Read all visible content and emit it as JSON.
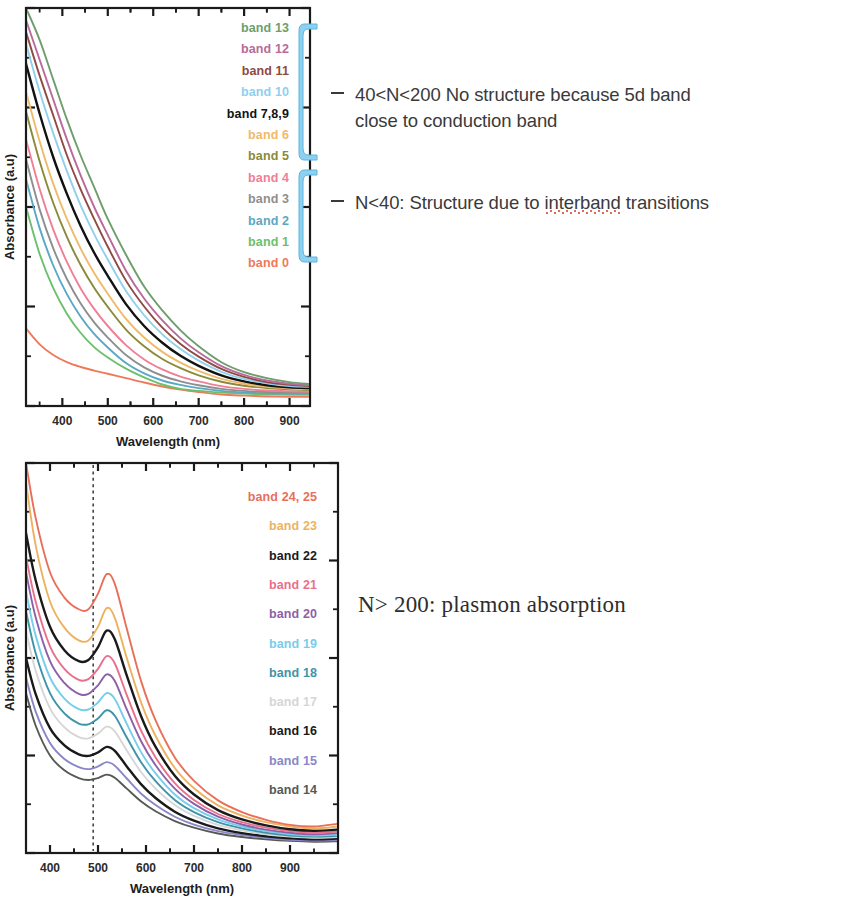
{
  "figures": [
    {
      "id": "top",
      "axis": {
        "xlabel": "Wavelength (nm)",
        "ylabel": "Absorbance (a.u)",
        "xticks": [
          "400",
          "500",
          "600",
          "700",
          "800",
          "900"
        ]
      },
      "legend": [
        {
          "label": "band 13",
          "color": "#6d9e6b"
        },
        {
          "label": "band 12",
          "color": "#b96a9a"
        },
        {
          "label": "band 11",
          "color": "#8e4a43"
        },
        {
          "label": "band 10",
          "color": "#8fd0ee"
        },
        {
          "label": "band 7,8,9",
          "color": "#121212"
        },
        {
          "label": "band 6",
          "color": "#f0ba6a"
        },
        {
          "label": "band 5",
          "color": "#8a8a38"
        },
        {
          "label": "band 4",
          "color": "#ef7f96"
        },
        {
          "label": "band 3",
          "color": "#8d8f8e"
        },
        {
          "label": "band 2",
          "color": "#5aa8c4"
        },
        {
          "label": "band 1",
          "color": "#6cc06c"
        },
        {
          "label": "band 0",
          "color": "#ef7a5a"
        }
      ]
    },
    {
      "id": "bottom",
      "axis": {
        "xlabel": "Wavelength (nm)",
        "ylabel": "Absorbance (a.u)",
        "xticks": [
          "400",
          "500",
          "600",
          "700",
          "800",
          "900"
        ]
      },
      "legend": [
        {
          "label": "band 24, 25",
          "color": "#e8705a"
        },
        {
          "label": "band 23",
          "color": "#edb25f"
        },
        {
          "label": "band 22",
          "color": "#1a1a1a"
        },
        {
          "label": "band 21",
          "color": "#e8708c"
        },
        {
          "label": "band 20",
          "color": "#8e5fa8"
        },
        {
          "label": "band 19",
          "color": "#77cdea"
        },
        {
          "label": "band 18",
          "color": "#3f93a8"
        },
        {
          "label": "band 17",
          "color": "#d6d6d6"
        },
        {
          "label": "band 16",
          "color": "#1a1a1a"
        },
        {
          "label": "band 15",
          "color": "#8a86c8"
        },
        {
          "label": "band 14",
          "color": "#555a55"
        }
      ]
    }
  ],
  "annotations": {
    "high_n_line1": "40<N<200 No structure because 5d band",
    "high_n_line2": "close to conduction band",
    "low_n_prefix": "N<40: Structure due to ",
    "low_n_misspelled": "interband",
    "low_n_suffix": " transitions",
    "plasmon": "N> 200: plasmon absorption",
    "bracket_color": "#8dd0f0"
  },
  "chart_data": [
    {
      "type": "line",
      "title": "",
      "xlabel": "Wavelength (nm)",
      "ylabel": "Absorbance (a.u)",
      "xlim": [
        320,
        945
      ],
      "ylim": [
        0,
        1
      ],
      "xticks": [
        400,
        500,
        600,
        700,
        800,
        900
      ],
      "grid": false,
      "legend_position": "inside-top-right",
      "note": "Monotonically decaying interband-absorption curves, no plasmon peak. N<200 gold clusters.",
      "x": [
        320,
        350,
        380,
        410,
        440,
        470,
        500,
        540,
        580,
        620,
        660,
        700,
        750,
        800,
        850,
        900,
        945
      ],
      "series": [
        {
          "name": "band 13",
          "color": "#6d9e6b",
          "values": [
            1.0,
            0.92,
            0.82,
            0.72,
            0.63,
            0.55,
            0.47,
            0.38,
            0.3,
            0.24,
            0.19,
            0.15,
            0.11,
            0.085,
            0.07,
            0.06,
            0.055
          ]
        },
        {
          "name": "band 12",
          "color": "#b96a9a",
          "values": [
            0.97,
            0.87,
            0.77,
            0.67,
            0.58,
            0.5,
            0.43,
            0.34,
            0.27,
            0.215,
            0.17,
            0.135,
            0.1,
            0.078,
            0.064,
            0.056,
            0.052
          ]
        },
        {
          "name": "band 11",
          "color": "#8e4a43",
          "values": [
            0.94,
            0.83,
            0.73,
            0.63,
            0.545,
            0.47,
            0.4,
            0.315,
            0.25,
            0.197,
            0.156,
            0.124,
            0.093,
            0.073,
            0.06,
            0.053,
            0.05
          ]
        },
        {
          "name": "band 10",
          "color": "#8fd0ee",
          "values": [
            0.91,
            0.79,
            0.685,
            0.59,
            0.505,
            0.432,
            0.368,
            0.289,
            0.228,
            0.18,
            0.143,
            0.114,
            0.086,
            0.068,
            0.057,
            0.05,
            0.048
          ]
        },
        {
          "name": "band 7,8,9",
          "color": "#121212",
          "values": [
            0.86,
            0.735,
            0.625,
            0.533,
            0.453,
            0.385,
            0.327,
            0.256,
            0.201,
            0.159,
            0.126,
            0.101,
            0.077,
            0.062,
            0.052,
            0.047,
            0.045
          ]
        },
        {
          "name": "band 6",
          "color": "#f0ba6a",
          "values": [
            0.79,
            0.665,
            0.558,
            0.47,
            0.396,
            0.334,
            0.282,
            0.219,
            0.172,
            0.136,
            0.109,
            0.088,
            0.068,
            0.056,
            0.048,
            0.044,
            0.042
          ]
        },
        {
          "name": "band 5",
          "color": "#8a8a38",
          "values": [
            0.74,
            0.615,
            0.51,
            0.425,
            0.355,
            0.297,
            0.249,
            0.192,
            0.15,
            0.118,
            0.095,
            0.077,
            0.061,
            0.051,
            0.045,
            0.042,
            0.04
          ]
        },
        {
          "name": "band 4",
          "color": "#ef7f96",
          "values": [
            0.67,
            0.545,
            0.443,
            0.362,
            0.296,
            0.244,
            0.201,
            0.153,
            0.117,
            0.092,
            0.074,
            0.062,
            0.05,
            0.043,
            0.039,
            0.037,
            0.036
          ]
        },
        {
          "name": "band 3",
          "color": "#8d8f8e",
          "values": [
            0.62,
            0.494,
            0.396,
            0.319,
            0.258,
            0.21,
            0.172,
            0.128,
            0.097,
            0.076,
            0.062,
            0.052,
            0.043,
            0.038,
            0.035,
            0.034,
            0.033
          ]
        },
        {
          "name": "band 2",
          "color": "#5aa8c4",
          "values": [
            0.57,
            0.447,
            0.353,
            0.281,
            0.225,
            0.181,
            0.147,
            0.108,
            0.082,
            0.064,
            0.053,
            0.045,
            0.038,
            0.034,
            0.032,
            0.031,
            0.031
          ]
        },
        {
          "name": "band 1",
          "color": "#6cc06c",
          "values": [
            0.5,
            0.382,
            0.296,
            0.232,
            0.184,
            0.148,
            0.122,
            0.094,
            0.072,
            0.054,
            0.043,
            0.038,
            0.034,
            0.031,
            0.029,
            0.028,
            0.028
          ]
        },
        {
          "name": "band 0",
          "color": "#ef7a5a",
          "values": [
            0.195,
            0.155,
            0.128,
            0.11,
            0.098,
            0.089,
            0.081,
            0.07,
            0.059,
            0.049,
            0.041,
            0.035,
            0.029,
            0.026,
            0.024,
            0.023,
            0.023
          ]
        }
      ]
    },
    {
      "type": "line",
      "title": "",
      "xlabel": "Wavelength (nm)",
      "ylabel": "Absorbance (a.u)",
      "xlim": [
        350,
        1000
      ],
      "ylim": [
        0,
        1
      ],
      "xticks": [
        400,
        500,
        600,
        700,
        800,
        900
      ],
      "grid": false,
      "legend_position": "inside-top-right",
      "marker_line_nm": 490,
      "plasmon_peak_nm": 518,
      "note": "Surface plasmon resonance band near 518 nm for N>200 gold nanoparticles. Dashed vertical guide at 490 nm.",
      "x": [
        350,
        370,
        400,
        430,
        460,
        480,
        500,
        518,
        535,
        560,
        590,
        620,
        660,
        700,
        750,
        800,
        850,
        900,
        950,
        1000
      ],
      "series": [
        {
          "name": "band 24, 25",
          "color": "#e8705a",
          "values": [
            1.0,
            0.86,
            0.72,
            0.655,
            0.625,
            0.625,
            0.665,
            0.715,
            0.69,
            0.575,
            0.44,
            0.34,
            0.245,
            0.185,
            0.135,
            0.105,
            0.085,
            0.072,
            0.068,
            0.075
          ]
        },
        {
          "name": "band 23",
          "color": "#edb25f",
          "values": [
            0.95,
            0.79,
            0.645,
            0.578,
            0.545,
            0.545,
            0.58,
            0.628,
            0.603,
            0.5,
            0.385,
            0.3,
            0.218,
            0.166,
            0.122,
            0.096,
            0.079,
            0.068,
            0.063,
            0.068
          ]
        },
        {
          "name": "band 22",
          "color": "#1a1a1a",
          "values": [
            0.82,
            0.7,
            0.58,
            0.52,
            0.492,
            0.495,
            0.528,
            0.57,
            0.548,
            0.455,
            0.35,
            0.272,
            0.198,
            0.15,
            0.11,
            0.086,
            0.071,
            0.061,
            0.057,
            0.06
          ]
        },
        {
          "name": "band 21",
          "color": "#e8708c",
          "values": [
            0.76,
            0.645,
            0.53,
            0.472,
            0.444,
            0.446,
            0.472,
            0.505,
            0.486,
            0.405,
            0.313,
            0.245,
            0.179,
            0.136,
            0.1,
            0.079,
            0.065,
            0.056,
            0.052,
            0.055
          ]
        },
        {
          "name": "band 20",
          "color": "#8e5fa8",
          "values": [
            0.72,
            0.605,
            0.492,
            0.436,
            0.408,
            0.408,
            0.43,
            0.458,
            0.441,
            0.368,
            0.286,
            0.225,
            0.165,
            0.126,
            0.093,
            0.073,
            0.06,
            0.052,
            0.048,
            0.051
          ]
        },
        {
          "name": "band 19",
          "color": "#77cdea",
          "values": [
            0.67,
            0.558,
            0.45,
            0.396,
            0.369,
            0.368,
            0.386,
            0.41,
            0.395,
            0.331,
            0.258,
            0.204,
            0.15,
            0.115,
            0.086,
            0.068,
            0.056,
            0.048,
            0.045,
            0.047
          ]
        },
        {
          "name": "band 18",
          "color": "#3f93a8",
          "values": [
            0.62,
            0.513,
            0.41,
            0.358,
            0.332,
            0.33,
            0.345,
            0.366,
            0.352,
            0.296,
            0.232,
            0.184,
            0.136,
            0.105,
            0.079,
            0.063,
            0.052,
            0.045,
            0.042,
            0.044
          ]
        },
        {
          "name": "band 17",
          "color": "#d6d6d6",
          "values": [
            0.57,
            0.468,
            0.371,
            0.322,
            0.297,
            0.294,
            0.306,
            0.324,
            0.312,
            0.263,
            0.207,
            0.165,
            0.123,
            0.095,
            0.072,
            0.058,
            0.048,
            0.042,
            0.039,
            0.041
          ]
        },
        {
          "name": "band 16",
          "color": "#1a1a1a",
          "values": [
            0.5,
            0.408,
            0.32,
            0.276,
            0.253,
            0.249,
            0.258,
            0.272,
            0.262,
            0.222,
            0.176,
            0.141,
            0.106,
            0.083,
            0.063,
            0.051,
            0.043,
            0.038,
            0.035,
            0.037
          ]
        },
        {
          "name": "band 15",
          "color": "#8a86c8",
          "values": [
            0.45,
            0.363,
            0.282,
            0.241,
            0.22,
            0.215,
            0.222,
            0.233,
            0.224,
            0.191,
            0.152,
            0.123,
            0.093,
            0.073,
            0.056,
            0.046,
            0.039,
            0.034,
            0.032,
            0.033
          ]
        },
        {
          "name": "band 14",
          "color": "#555a55",
          "values": [
            0.41,
            0.327,
            0.25,
            0.212,
            0.192,
            0.187,
            0.192,
            0.201,
            0.193,
            0.165,
            0.132,
            0.107,
            0.082,
            0.065,
            0.05,
            0.041,
            0.035,
            0.031,
            0.029,
            0.03
          ]
        }
      ]
    }
  ]
}
